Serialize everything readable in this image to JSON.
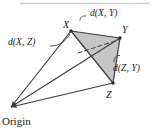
{
  "figure": {
    "type": "geometry-diagram",
    "colors": {
      "stroke": "#3c3c3c",
      "triangle_fill": "#c6c6c6",
      "text": "#1a1a1a",
      "top_rule": "#cfcfcf",
      "background": "#ffffff"
    },
    "labels": {
      "d_xy": "d(X, Y)",
      "d_xz": "d(X, Z)",
      "d_zy": "d(Z, Y)",
      "vertex_x": "X",
      "vertex_y": "Y",
      "vertex_z": "Z",
      "origin": "Origin"
    },
    "points": {
      "origin": [
        10,
        108
      ],
      "x": [
        71,
        31
      ],
      "y": [
        120,
        38
      ],
      "z": [
        113,
        83
      ]
    },
    "edges": [
      {
        "name": "origin-to-x",
        "from": "origin",
        "to": "x",
        "style": "solid",
        "arrow": "to-origin"
      },
      {
        "name": "origin-to-y",
        "from": "origin",
        "to": "y",
        "style": "solid",
        "arrow": "to-origin"
      },
      {
        "name": "origin-to-z",
        "from": "origin",
        "to": "z",
        "style": "solid",
        "arrow": "to-origin"
      },
      {
        "name": "x-to-y",
        "from": "x",
        "to": "y",
        "style": "solid"
      },
      {
        "name": "x-to-z",
        "from": "x",
        "to": "z",
        "style": "solid"
      },
      {
        "name": "z-to-y",
        "from": "z",
        "to": "y",
        "style": "solid"
      },
      {
        "name": "x-to-y-interior",
        "from": "x",
        "to": "y",
        "style": "dashed"
      }
    ],
    "shaded_face": [
      "x",
      "y",
      "z"
    ]
  }
}
